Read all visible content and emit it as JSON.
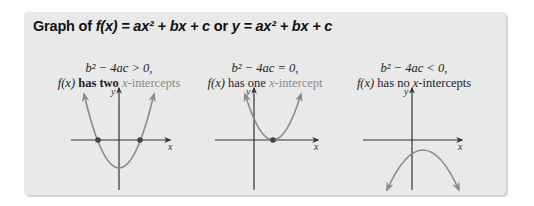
{
  "title": {
    "prefix": "Graph of ",
    "f": "f",
    "paren_x": "(x)",
    "eq1": " = ax² + bx + c",
    "or": " or ",
    "eq2": "y = ax² + bx + c"
  },
  "panels": [
    {
      "condition": "b² − 4ac > 0,",
      "f": "f(x)",
      "has": " has two ",
      "x": "x",
      "rest": "-intercepts"
    },
    {
      "condition": "b² − 4ac = 0,",
      "f": "f(x)",
      "has": " has one ",
      "x": "x",
      "rest": "-intercept"
    },
    {
      "condition": "b² − 4ac < 0,",
      "f": "f(x)",
      "has": " has no ",
      "x": "x",
      "rest": "-intercepts"
    }
  ],
  "axis_labels": {
    "x": "x",
    "y": "y"
  },
  "colors": {
    "curve": "#8a8a8a",
    "axis": "#333333",
    "point": "#444444",
    "background": "#e9e9e9"
  }
}
